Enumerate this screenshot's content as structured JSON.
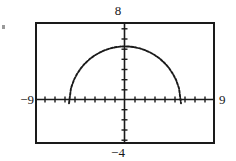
{
  "window": {
    "xmin_label": "−9",
    "xmax_label": "9",
    "ymax_label": "8",
    "ymin_label": "−4"
  },
  "chart_data": {
    "type": "line",
    "title": "",
    "xlabel": "",
    "ylabel": "",
    "xlim": [
      -9,
      9
    ],
    "ylim": [
      -4,
      8
    ],
    "grid": false,
    "legend": "none",
    "axes": {
      "x_axis_at_y": 0,
      "y_axis_at_x": 0,
      "x_tick_interval": 1,
      "y_tick_interval": 1,
      "x_ticks": [
        -8,
        -7,
        -6,
        -5,
        -4,
        -3,
        -2,
        -1,
        1,
        2,
        3,
        4,
        5,
        6,
        7,
        8
      ],
      "y_ticks": [
        -3,
        -2,
        -1,
        1,
        2,
        3,
        4,
        5,
        6,
        7
      ],
      "tick_style": "hash-marks"
    },
    "series": [
      {
        "name": "semicircle",
        "description": "upper half of a circle centered at origin",
        "equation": "y = sqrt(r^2 - x^2)",
        "radius": 5.6,
        "style": "dotted",
        "color": "#1a1a1a",
        "x": [
          -5.6,
          -5.4,
          -5.1,
          -4.8,
          -4.4,
          -4.0,
          -3.5,
          -3.0,
          -2.5,
          -2.0,
          -1.5,
          -1.0,
          -0.5,
          0.0,
          0.5,
          1.0,
          1.5,
          2.0,
          2.5,
          3.0,
          3.5,
          4.0,
          4.4,
          4.8,
          5.1,
          5.4,
          5.6
        ],
        "y": [
          0.0,
          1.49,
          2.32,
          2.88,
          3.47,
          3.92,
          4.38,
          4.73,
          5.01,
          5.23,
          5.4,
          5.51,
          5.58,
          5.6,
          5.58,
          5.51,
          5.4,
          5.23,
          5.01,
          4.73,
          4.38,
          3.92,
          3.47,
          2.88,
          2.32,
          1.49,
          0.0
        ]
      }
    ]
  }
}
